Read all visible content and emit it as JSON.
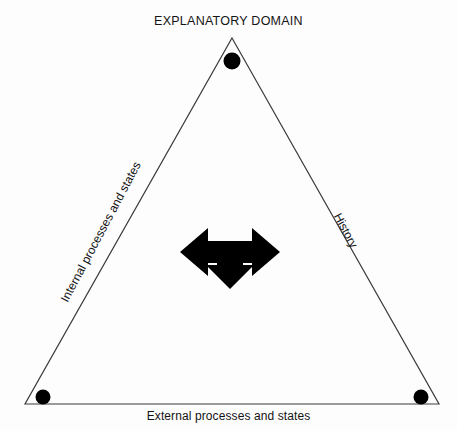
{
  "diagram": {
    "title": "EXPLANATORY DOMAIN",
    "shape": "triangle",
    "vertices": [
      {
        "name": "apex",
        "label": "EXPLANATORY DOMAIN",
        "x": 232,
        "y": 38,
        "marker": "filled-circle"
      },
      {
        "name": "bottom-left",
        "x": 25,
        "y": 404,
        "marker": "filled-circle"
      },
      {
        "name": "bottom-right",
        "x": 439,
        "y": 404,
        "marker": "filled-circle"
      }
    ],
    "edges": [
      {
        "name": "left-edge",
        "label": "Internal processes and states",
        "rotation_deg": -62
      },
      {
        "name": "right-edge",
        "label": "History",
        "rotation_deg": 62
      },
      {
        "name": "base-edge",
        "label": "External processes and states",
        "rotation_deg": 0
      }
    ],
    "center_symbol": {
      "name": "three-way-arrow",
      "directions": [
        "left",
        "right",
        "down"
      ]
    },
    "colors": {
      "stroke": "#3a3a3a",
      "fill": "#000000",
      "background": "#fdfdfd",
      "text": "#141414"
    }
  }
}
